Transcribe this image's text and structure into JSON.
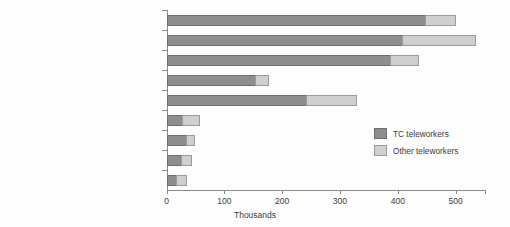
{
  "chart_data": {
    "type": "bar",
    "orientation": "horizontal",
    "stacked": true,
    "title": "",
    "xlabel": "Thousands",
    "ylabel": "",
    "xlim": [
      0,
      550
    ],
    "xticks": [
      0,
      100,
      200,
      300,
      400,
      500
    ],
    "xtick_labels": [
      "0",
      "100",
      "200",
      "300",
      "400",
      "500"
    ],
    "grid": false,
    "legend_position": "inside-right",
    "categories": [
      "Managers and senior officials",
      "Professionals",
      "Associate professionals and technical",
      "Administrative and secretarial",
      "Skilled trades",
      "Personal service",
      "Sales and customer service",
      "Process, plant and machine operatives",
      "Elementary"
    ],
    "series": [
      {
        "name": "TC teleworkers",
        "color": "#8e8e8e",
        "values": [
          448,
          409,
          388,
          155,
          243,
          28,
          36,
          27,
          18
        ]
      },
      {
        "name": "Other teleworkers",
        "color": "#cfcfcf",
        "values": [
          52,
          126,
          49,
          23,
          87,
          30,
          14,
          17,
          18
        ]
      }
    ],
    "totals": [
      500,
      535,
      437,
      178,
      330,
      58,
      50,
      44,
      36
    ]
  },
  "legend": {
    "items": [
      {
        "label": "TC teleworkers",
        "swatch": "tc"
      },
      {
        "label": "Other teleworkers",
        "swatch": "other"
      }
    ]
  },
  "axis": {
    "x_title": "Thousands"
  }
}
